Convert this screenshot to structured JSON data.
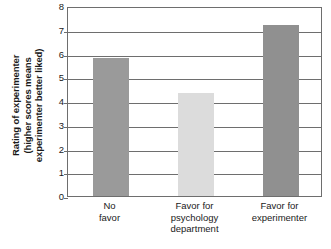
{
  "chart_data": {
    "type": "bar",
    "title": "",
    "subtitle": "",
    "xlabel": "",
    "ylabel": "Rating of experimenter (higher scores means experimenter better liked)",
    "ylabel_lines": [
      "Rating of experimenter",
      "(higher scores means",
      "experimenter better liked)"
    ],
    "categories": [
      "No favor",
      "Favor for psychology department",
      "Favor for experimenter"
    ],
    "category_lines": [
      [
        "No",
        "favor"
      ],
      [
        "Favor for",
        "psychology",
        "department"
      ],
      [
        "Favor for",
        "experimenter"
      ]
    ],
    "values": [
      5.8,
      4.35,
      7.2
    ],
    "ylim": [
      0,
      8
    ],
    "ytick_step": 1,
    "ytick_labels": [
      "8",
      "7",
      "6",
      "5",
      "4",
      "3",
      "2",
      "1",
      "0"
    ],
    "ytick_values": [
      8,
      7,
      6,
      5,
      4,
      3,
      2,
      1,
      0
    ],
    "grid": true,
    "legend": false,
    "bar_colors": [
      "#9a9a9a",
      "#dcdcdc",
      "#909090"
    ],
    "axis_color": "#6e6e6e",
    "background": "#ffffff"
  }
}
